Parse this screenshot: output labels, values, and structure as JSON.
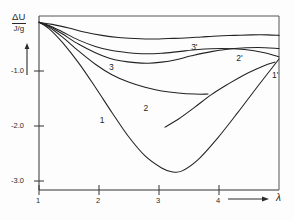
{
  "chart_data": {
    "type": "line",
    "title": "",
    "ylabel": "ΔU",
    "yunit": "J/g",
    "xlabel": "λ",
    "xlim": [
      1,
      4.62
    ],
    "ylim": [
      -3.2,
      0.12
    ],
    "grid": false,
    "legend": "inline-curve-labels",
    "xticks": [
      "1",
      "2",
      "3",
      "4"
    ],
    "xtick_values": [
      1,
      2,
      3,
      4
    ],
    "yticks": [
      "-1.0",
      "-2.0",
      "-3.0"
    ],
    "ytick_values": [
      -1.0,
      -2.0,
      -3.0
    ],
    "axis_arrows": {
      "y": "up",
      "x": "right"
    },
    "series": [
      {
        "name": "1",
        "label": "1",
        "x": [
          1.0,
          1.15,
          1.35,
          1.6,
          1.85,
          2.1,
          2.35,
          2.6,
          2.85,
          3.0,
          3.15,
          3.4,
          3.7,
          4.0,
          4.3,
          4.62
        ],
        "values": [
          0.0,
          -0.12,
          -0.38,
          -0.78,
          -1.24,
          -1.72,
          -2.18,
          -2.55,
          -2.78,
          -2.85,
          -2.84,
          -2.62,
          -2.2,
          -1.72,
          -1.22,
          -0.7
        ]
      },
      {
        "name": "2",
        "label": "2",
        "x": [
          1.0,
          1.15,
          1.35,
          1.6,
          1.85,
          2.1,
          2.35,
          2.6,
          2.85,
          3.1,
          3.35,
          3.55
        ],
        "values": [
          0.0,
          -0.09,
          -0.28,
          -0.55,
          -0.8,
          -1.0,
          -1.14,
          -1.24,
          -1.31,
          -1.35,
          -1.37,
          -1.37
        ]
      },
      {
        "name": "3",
        "label": "3",
        "x": [
          1.0,
          1.15,
          1.35,
          1.6,
          1.85,
          2.05,
          2.25,
          2.45,
          2.65,
          2.85,
          3.05,
          3.3,
          3.6,
          3.95,
          4.3,
          4.62
        ],
        "values": [
          0.0,
          -0.07,
          -0.22,
          -0.42,
          -0.58,
          -0.68,
          -0.74,
          -0.77,
          -0.78,
          -0.76,
          -0.72,
          -0.64,
          -0.56,
          -0.5,
          -0.48,
          -0.5
        ]
      },
      {
        "name": "1'",
        "label": "1'",
        "x": [
          2.9,
          3.1,
          3.35,
          3.6,
          3.85,
          4.1,
          4.3,
          4.45,
          4.56
        ],
        "values": [
          -2.0,
          -1.85,
          -1.62,
          -1.38,
          -1.18,
          -1.0,
          -0.88,
          -0.8,
          -0.76
        ]
      },
      {
        "name": "2'",
        "label": "2'",
        "x": [
          1.0,
          1.15,
          1.35,
          1.6,
          1.85,
          2.1,
          2.35,
          2.6,
          2.85,
          3.1,
          3.4,
          3.75,
          4.1,
          4.4,
          4.62
        ],
        "values": [
          0.0,
          -0.06,
          -0.18,
          -0.34,
          -0.46,
          -0.54,
          -0.58,
          -0.6,
          -0.59,
          -0.56,
          -0.52,
          -0.5,
          -0.52,
          -0.58,
          -0.66
        ]
      },
      {
        "name": "3'",
        "label": "3'",
        "x": [
          1.0,
          1.2,
          1.45,
          1.7,
          1.95,
          2.2,
          2.45,
          2.7,
          2.95,
          3.2,
          3.45,
          3.7,
          3.95,
          4.2,
          4.45,
          4.62
        ],
        "values": [
          0.0,
          -0.04,
          -0.11,
          -0.19,
          -0.25,
          -0.29,
          -0.31,
          -0.32,
          -0.31,
          -0.3,
          -0.28,
          -0.26,
          -0.25,
          -0.24,
          -0.24,
          -0.25
        ]
      }
    ],
    "annotations": [
      {
        "text": "3",
        "x": 2.1,
        "y": -0.88
      },
      {
        "text": "3'",
        "x": 3.34,
        "y": -0.5
      },
      {
        "text": "2",
        "x": 2.62,
        "y": -1.66
      },
      {
        "text": "2'",
        "x": 4.02,
        "y": -0.7
      },
      {
        "text": "1",
        "x": 1.96,
        "y": -1.88
      },
      {
        "text": "1'",
        "x": 4.56,
        "y": -1.02
      }
    ]
  }
}
